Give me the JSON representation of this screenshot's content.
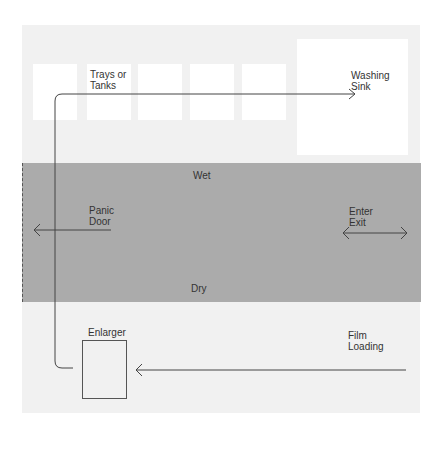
{
  "diagram": {
    "type": "darkroom-floor-plan",
    "areas": {
      "wet_label": "Wet",
      "dry_label": "Dry"
    },
    "stations": {
      "trays_label_line1": "Trays or",
      "trays_label_line2": "Tanks",
      "sink_label_line1": "Washing",
      "sink_label_line2": "Sink",
      "enlarger_label": "Enlarger",
      "film_label_line1": "Film",
      "film_label_line2": "Loading"
    },
    "doors": {
      "panic_line1": "Panic",
      "panic_line2": "Door",
      "enter_line1": "Enter",
      "enter_line2": "Exit"
    },
    "colors": {
      "floor": "#f1f1f1",
      "band": "#ababab",
      "line": "#444444"
    }
  }
}
